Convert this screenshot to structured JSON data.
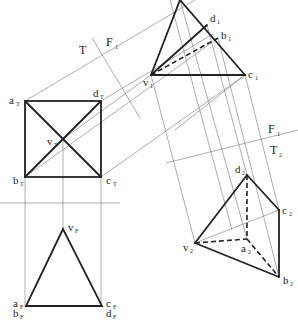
{
  "fold_lines": {
    "tf_top": "T",
    "tf_side": "F",
    "tf_side_sub": "1",
    "f1_label": "F",
    "f1_sub": "1",
    "t2_label": "T",
    "t2_sub": "2"
  },
  "labels": {
    "aT": {
      "main": "a",
      "sub": "T"
    },
    "dT": {
      "main": "d",
      "sub": "T"
    },
    "bT": {
      "main": "b",
      "sub": "T"
    },
    "cT": {
      "main": "c",
      "sub": "T"
    },
    "vT": {
      "main": "v",
      "sub": "T"
    },
    "vF": {
      "main": "v",
      "sub": "F"
    },
    "aF": {
      "main": "a",
      "sub": "F"
    },
    "bF": {
      "main": "b",
      "sub": "F"
    },
    "cF": {
      "main": "c",
      "sub": "F"
    },
    "dF": {
      "main": "d",
      "sub": "F"
    },
    "v1": {
      "main": "v",
      "sub": "1"
    },
    "d1": {
      "main": "d",
      "sub": "1"
    },
    "b1": {
      "main": "b",
      "sub": "1"
    },
    "c1": {
      "main": "c",
      "sub": "1"
    },
    "v2": {
      "main": "v",
      "sub": "2"
    },
    "a2": {
      "main": "a",
      "sub": "2"
    },
    "b2": {
      "main": "b",
      "sub": "2"
    },
    "c2": {
      "main": "c",
      "sub": "2"
    },
    "d2": {
      "main": "d",
      "sub": "2"
    }
  }
}
